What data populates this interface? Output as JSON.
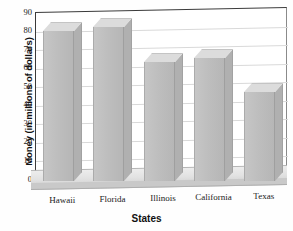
{
  "chart_data": {
    "type": "bar",
    "title": "",
    "subtitle": "",
    "xlabel": "States",
    "ylabel": "Money (in millions of dollars)",
    "categories": [
      "Hawaii",
      "Florida",
      "Illinois",
      "California",
      "Texas"
    ],
    "values": [
      80,
      82,
      63,
      65,
      47
    ],
    "ylim": [
      0,
      90
    ],
    "ytick_values": [
      0,
      10,
      20,
      30,
      40,
      50,
      60,
      70,
      80,
      90
    ],
    "ytick_labels": [
      "0",
      "10",
      "20",
      "30",
      "40",
      "50",
      "60",
      "70",
      "80",
      "90"
    ],
    "grid": true,
    "legend": false,
    "legend_position": "none",
    "series": [
      {
        "name": "Money",
        "values": [
          80,
          82,
          63,
          65,
          47
        ]
      }
    ],
    "style": "3d-column",
    "bar_color": "#bebebe",
    "bar_top_color": "#dcdcdc",
    "bar_side_color": "#b0b0b0",
    "grid_color": "#d9d9d9",
    "axis_color": "#3a3a3a",
    "background": "#ffffff"
  }
}
